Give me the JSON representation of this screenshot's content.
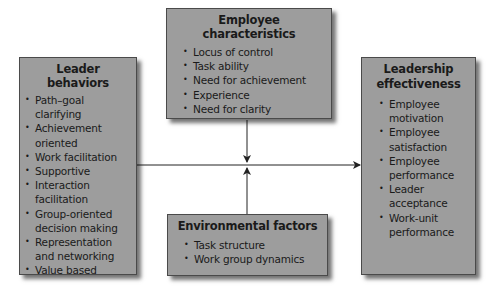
{
  "diagram": {
    "leader_behaviors": {
      "title": "Leader behaviors",
      "items": [
        "Path–goal clarifying",
        "Achievement oriented",
        "Work facilitation",
        "Supportive",
        "Interaction facilitation",
        "Group-oriented decision making",
        "Representation and networking",
        "Value based"
      ]
    },
    "employee_characteristics": {
      "title": "Employee characteristics",
      "items": [
        "Locus of control",
        "Task ability",
        "Need for achievement",
        "Experience",
        "Need for clarity"
      ]
    },
    "environmental_factors": {
      "title": "Environmental factors",
      "items": [
        "Task structure",
        "Work group dynamics"
      ]
    },
    "leadership_effectiveness": {
      "title": "Leadership effectiveness",
      "items": [
        "Employee motivation",
        "Employee satisfaction",
        "Employee performance",
        "Leader acceptance",
        "Work-unit performance"
      ]
    },
    "colors": {
      "box_fill": "#9d9d9d",
      "box_border": "#4a4a4a",
      "line": "#222222"
    }
  }
}
